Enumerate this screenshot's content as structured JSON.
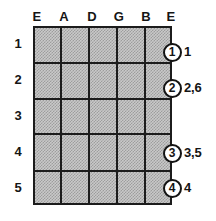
{
  "diagram": {
    "neck": {
      "left": 33,
      "right": 172,
      "top": 26,
      "bottom": 205,
      "fill_color": "#c9c9c9",
      "line_color": "#1c1c1c"
    },
    "string_labels": [
      {
        "name": "E",
        "x": 37
      },
      {
        "name": "A",
        "x": 64
      },
      {
        "name": "D",
        "x": 92
      },
      {
        "name": "G",
        "x": 119
      },
      {
        "name": "B",
        "x": 146
      },
      {
        "name": "E",
        "x": 171
      }
    ],
    "string_lines_x": [
      33,
      61,
      89,
      117,
      145,
      172
    ],
    "fret_numbers": [
      {
        "label": "1",
        "x": 18,
        "y": 44
      },
      {
        "label": "2",
        "x": 18,
        "y": 80
      },
      {
        "label": "3",
        "x": 18,
        "y": 116
      },
      {
        "label": "4",
        "x": 18,
        "y": 152
      },
      {
        "label": "5",
        "x": 18,
        "y": 188
      }
    ],
    "fret_lines_y": [
      62,
      98,
      133,
      170
    ],
    "markers": [
      {
        "finger": "1",
        "caption": "1",
        "x": 172,
        "y": 52
      },
      {
        "finger": "2",
        "caption": "2,6",
        "x": 172,
        "y": 88
      },
      {
        "finger": "3",
        "caption": "3,5",
        "x": 172,
        "y": 153
      },
      {
        "finger": "4",
        "caption": "4",
        "x": 172,
        "y": 188
      }
    ]
  }
}
